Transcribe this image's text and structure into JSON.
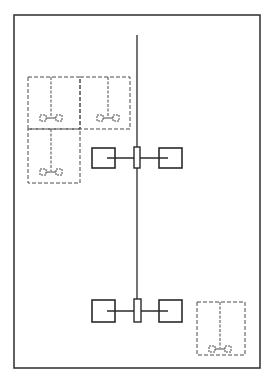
{
  "diagram": {
    "canvas": {
      "width": 270,
      "height": 377,
      "background": "#ffffff"
    },
    "colors": {
      "stroke": "#2a2a2a",
      "frame": "#3a3a3a",
      "dashed": "#4a4a4a"
    },
    "frame": {
      "x": 14,
      "y": 15,
      "w": 246,
      "h": 353
    },
    "spine": {
      "x": 137,
      "y1": 35,
      "y2": 299
    },
    "assemblies": [
      {
        "id": "upper-assembly",
        "line_y": 158,
        "line_x1": 107,
        "line_x2": 168,
        "left_box": {
          "x": 92,
          "y": 148,
          "w": 23,
          "h": 20
        },
        "center_rect": {
          "x": 134,
          "y": 147,
          "w": 6,
          "h": 21
        },
        "right_box": {
          "x": 159,
          "y": 148,
          "w": 23,
          "h": 20
        }
      },
      {
        "id": "lower-assembly",
        "line_y": 311,
        "line_x1": 107,
        "line_x2": 168,
        "left_box": {
          "x": 92,
          "y": 300,
          "w": 23,
          "h": 22
        },
        "center_rect": {
          "x": 134,
          "y": 299,
          "w": 7,
          "h": 23
        },
        "right_box": {
          "x": 159,
          "y": 300,
          "w": 23,
          "h": 22
        }
      }
    ],
    "dashed_units": [
      {
        "id": "unit-top-left",
        "x": 28,
        "y": 77,
        "w": 52,
        "h": 52,
        "stem_x": 51,
        "stem_y2": 117,
        "pad_y": 118
      },
      {
        "id": "unit-top-right",
        "x": 80,
        "y": 77,
        "w": 50,
        "h": 52,
        "stem_x": 108,
        "stem_y2": 117,
        "pad_y": 118
      },
      {
        "id": "unit-bottom-left",
        "x": 28,
        "y": 129,
        "w": 52,
        "h": 54,
        "stem_x": 51,
        "stem_y2": 171,
        "pad_y": 172
      },
      {
        "id": "unit-bottom-right",
        "x": 197,
        "y": 302,
        "w": 48,
        "h": 53,
        "stem_x": 220,
        "stem_y2": 348,
        "pad_y": 349
      }
    ]
  }
}
